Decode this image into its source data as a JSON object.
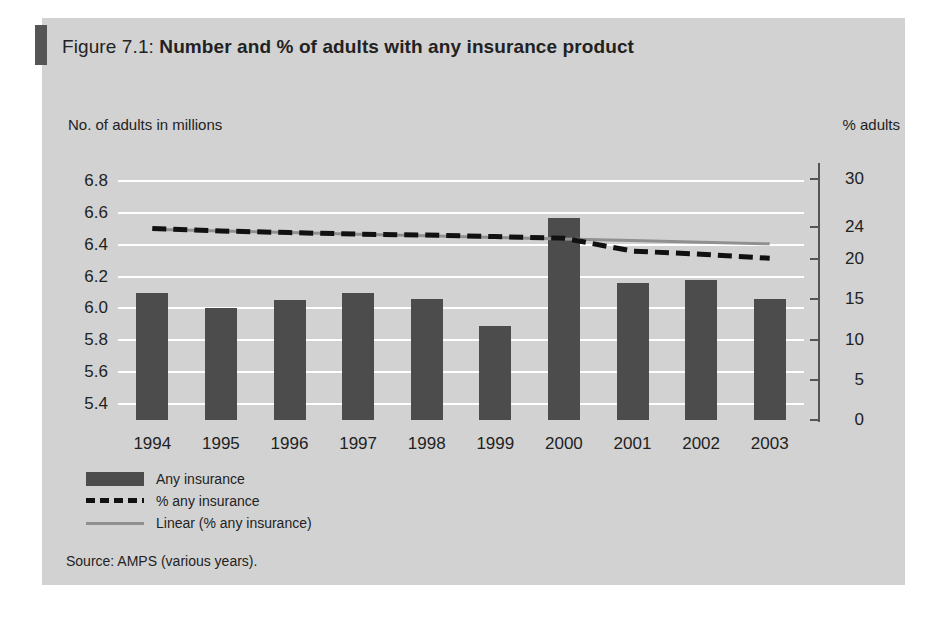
{
  "figure": {
    "caption_label": "Figure 7.1: ",
    "caption_title": "Number and % of adults with any insurance product",
    "source": "Source: AMPS (various years)."
  },
  "axes": {
    "left_title": "No. of adults in millions",
    "right_title": "% adults"
  },
  "legend": {
    "items": [
      {
        "label": "Any insurance",
        "key": "bar",
        "color": "#4c4c4c"
      },
      {
        "label": "% any insurance",
        "key": "dashed-line",
        "color": "#111111"
      },
      {
        "label": "Linear (% any insurance)",
        "key": "solid-line",
        "color": "#909090"
      }
    ]
  },
  "colors": {
    "panel_background": "#d2d2d2",
    "bar": "#4c4c4c",
    "gridline": "#ffffff",
    "dashed_series": "#111111",
    "trend_series": "#909090",
    "text": "#222222"
  },
  "chart_data": {
    "type": "bar",
    "title": "Number and % of adults with any insurance product",
    "xlabel": "",
    "ylabel": "No. of adults in millions",
    "y2label": "% adults",
    "grid": true,
    "legend_position": "below-left",
    "categories": [
      "1994",
      "1995",
      "1996",
      "1997",
      "1998",
      "1999",
      "2000",
      "2001",
      "2002",
      "2003"
    ],
    "ylim": [
      5.3,
      6.9
    ],
    "yticks": [
      "6.8",
      "6.6",
      "6.4",
      "6.2",
      "6.0",
      "5.8",
      "5.6",
      "5.4"
    ],
    "ytick_values": [
      6.8,
      6.6,
      6.4,
      6.2,
      6.0,
      5.8,
      5.6,
      5.4
    ],
    "y2lim": [
      0,
      31.7
    ],
    "y2ticks": [
      "30",
      "24",
      "20",
      "15",
      "10",
      "5",
      "0"
    ],
    "y2tick_values": [
      30,
      24,
      20,
      15,
      10,
      5,
      0
    ],
    "series": [
      {
        "name": "Any insurance",
        "type": "bar",
        "axis": "left",
        "unit": "millions",
        "values": [
          6.1,
          6.0,
          6.05,
          6.1,
          6.06,
          5.89,
          6.57,
          6.16,
          6.18,
          6.06
        ]
      },
      {
        "name": "% any insurance",
        "type": "line",
        "style": "dashed",
        "axis": "right",
        "unit": "percent",
        "values": [
          23.8,
          23.5,
          23.3,
          23.1,
          23.0,
          22.8,
          22.6,
          21.0,
          20.6,
          20.1
        ]
      },
      {
        "name": "Linear (% any insurance)",
        "type": "line",
        "style": "solid",
        "axis": "right",
        "unit": "percent",
        "values": [
          23.7,
          23.5,
          23.3,
          23.1,
          22.9,
          22.7,
          22.5,
          22.3,
          22.1,
          21.9
        ]
      }
    ]
  }
}
